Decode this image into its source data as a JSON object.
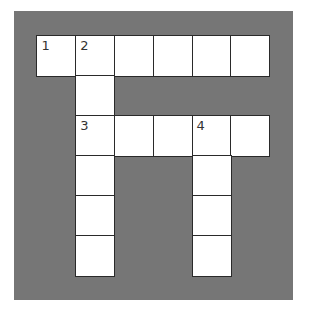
{
  "puzzle": {
    "type": "crossword",
    "rows": 6,
    "cols": 6,
    "cells": [
      {
        "r": 0,
        "c": 0,
        "num": "1"
      },
      {
        "r": 0,
        "c": 1,
        "num": "2"
      },
      {
        "r": 0,
        "c": 2
      },
      {
        "r": 0,
        "c": 3
      },
      {
        "r": 0,
        "c": 4
      },
      {
        "r": 0,
        "c": 5
      },
      {
        "r": 1,
        "c": 1
      },
      {
        "r": 2,
        "c": 1,
        "num": "3"
      },
      {
        "r": 2,
        "c": 2
      },
      {
        "r": 2,
        "c": 3
      },
      {
        "r": 2,
        "c": 4,
        "num": "4"
      },
      {
        "r": 2,
        "c": 5
      },
      {
        "r": 3,
        "c": 1
      },
      {
        "r": 3,
        "c": 4
      },
      {
        "r": 4,
        "c": 1
      },
      {
        "r": 4,
        "c": 4
      },
      {
        "r": 5,
        "c": 1
      },
      {
        "r": 5,
        "c": 4
      }
    ],
    "colors": {
      "background": "#767676",
      "cell": "#ffffff",
      "border": "#2a2a2a"
    }
  }
}
